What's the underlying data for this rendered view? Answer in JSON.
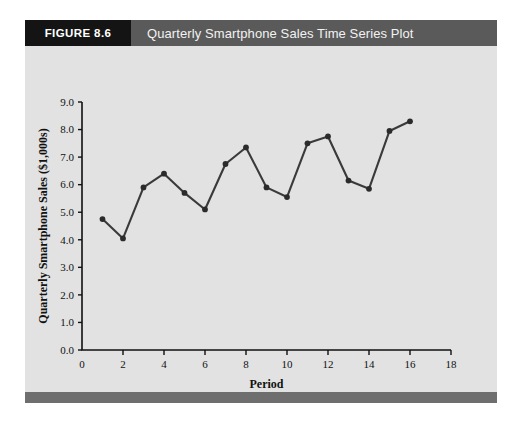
{
  "figure": {
    "label": "FIGURE 8.6",
    "title": "Quarterly Smartphone Sales Time Series Plot",
    "header_bg": "#5a5a5a",
    "tab_bg": "#141414",
    "body_bg": "#e2e2e2",
    "footer_bg": "#6e6e6e"
  },
  "chart_data": {
    "type": "line",
    "title": "Quarterly Smartphone Sales Time Series Plot",
    "xlabel": "Period",
    "ylabel": "Quarterly Smartphone Sales ($1,000s)",
    "xlim": [
      0,
      18
    ],
    "ylim": [
      0.0,
      9.0
    ],
    "xticks": [
      0,
      2,
      4,
      6,
      8,
      10,
      12,
      14,
      16,
      18
    ],
    "xtick_labels": [
      "0",
      "2",
      "4",
      "6",
      "8",
      "10",
      "12",
      "14",
      "16",
      "18"
    ],
    "yticks": [
      0.0,
      1.0,
      2.0,
      3.0,
      4.0,
      5.0,
      6.0,
      7.0,
      8.0,
      9.0
    ],
    "ytick_labels": [
      "0.0",
      "1.0",
      "2.0",
      "3.0",
      "4.0",
      "5.0",
      "6.0",
      "7.0",
      "8.0",
      "9.0"
    ],
    "grid": false,
    "legend": false,
    "line_color": "#3a3a3a",
    "marker_color": "#2b2b2b",
    "x": [
      1,
      2,
      3,
      4,
      5,
      6,
      7,
      8,
      9,
      10,
      11,
      12,
      13,
      14,
      15,
      16
    ],
    "values": [
      4.75,
      4.05,
      5.9,
      6.4,
      5.7,
      5.1,
      6.75,
      7.35,
      5.9,
      5.55,
      7.5,
      7.75,
      6.15,
      5.85,
      7.95,
      8.3
    ],
    "series": [
      {
        "name": "Quarterly Smartphone Sales",
        "values": [
          4.75,
          4.05,
          5.9,
          6.4,
          5.7,
          5.1,
          6.75,
          7.35,
          5.9,
          5.55,
          7.5,
          7.75,
          6.15,
          5.85,
          7.95,
          8.3
        ]
      }
    ]
  }
}
